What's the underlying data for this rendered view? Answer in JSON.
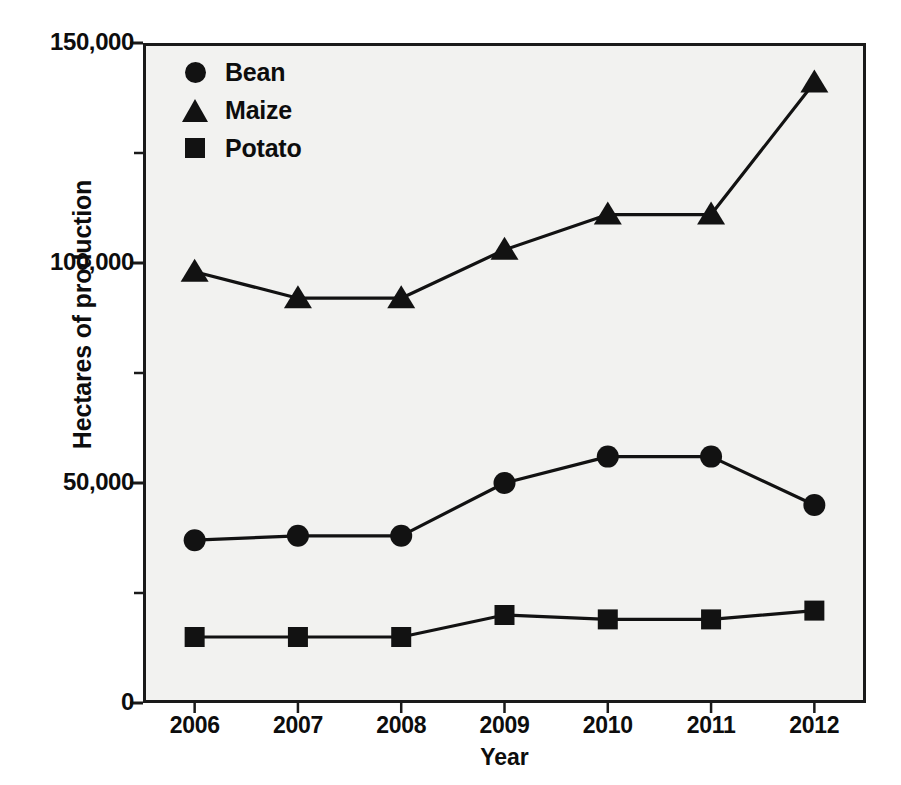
{
  "chart_data": {
    "type": "line",
    "title": "",
    "xlabel": "Year",
    "ylabel": "Hectares of production",
    "categories": [
      "2006",
      "2007",
      "2008",
      "2009",
      "2010",
      "2011",
      "2012"
    ],
    "x": [
      2006,
      2007,
      2008,
      2009,
      2010,
      2011,
      2012
    ],
    "xlim": [
      2005.5,
      2012.5
    ],
    "ylim": [
      0,
      150000
    ],
    "grid": false,
    "legend_position": "top-left",
    "y_ticks": [
      0,
      50000,
      100000,
      150000
    ],
    "y_tick_labels": [
      "0",
      "50,000",
      "100,000",
      "150,000"
    ],
    "y_minor_ticks": [
      25000,
      75000,
      125000
    ],
    "series": [
      {
        "name": "Bean",
        "marker": "circle",
        "color": "#121212",
        "values": [
          37000,
          38000,
          38000,
          50000,
          56000,
          56000,
          45000
        ]
      },
      {
        "name": "Maize",
        "marker": "triangle",
        "color": "#121212",
        "values": [
          98000,
          92000,
          92000,
          103000,
          111000,
          111000,
          141000
        ]
      },
      {
        "name": "Potato",
        "marker": "square",
        "color": "#121212",
        "values": [
          15000,
          15000,
          15000,
          20000,
          19000,
          19000,
          21000
        ]
      }
    ]
  },
  "axes": {
    "y_title": "Hectares of production",
    "x_title": "Year"
  },
  "legend": {
    "items": [
      {
        "label": "Bean",
        "marker": "circle-marker-icon"
      },
      {
        "label": "Maize",
        "marker": "triangle-marker-icon"
      },
      {
        "label": "Potato",
        "marker": "square-marker-icon"
      }
    ]
  },
  "colors": {
    "ink": "#121212",
    "axis": "#1a1a1a",
    "plot_background": "#f2f2f0",
    "page_background": "#ffffff"
  }
}
